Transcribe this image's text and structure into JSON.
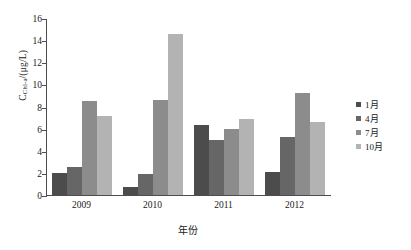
{
  "chart_data": {
    "type": "bar",
    "title": "",
    "xlabel": "年份",
    "ylabel": "C",
    "ylabel_sub": "Chl-a",
    "ylabel_unit": "/(μg/L)",
    "categories": [
      "2009",
      "2010",
      "2011",
      "2012"
    ],
    "series": [
      {
        "name": "1月",
        "color": "#4c4c4c",
        "values": [
          2.0,
          0.7,
          6.3,
          2.1
        ]
      },
      {
        "name": "4月",
        "color": "#666666",
        "values": [
          2.5,
          1.9,
          5.0,
          5.2
        ]
      },
      {
        "name": "7月",
        "color": "#8c8c8c",
        "values": [
          8.5,
          8.6,
          6.0,
          9.2
        ]
      },
      {
        "name": "10月",
        "color": "#b3b3b3",
        "values": [
          7.1,
          14.6,
          6.9,
          6.6
        ]
      }
    ],
    "yticks": [
      0,
      2,
      4,
      6,
      8,
      10,
      12,
      14,
      16
    ],
    "ylim": [
      0,
      16
    ],
    "grid": false,
    "legend_position": "right"
  }
}
